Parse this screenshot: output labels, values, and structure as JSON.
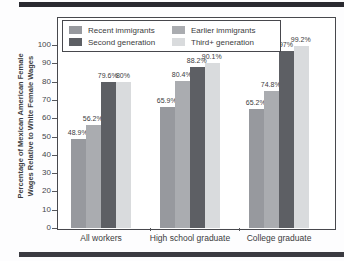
{
  "figure": {
    "background": "#fdfdfe",
    "top_rule_color": "#2a2a30",
    "bottom_rule_color": "#3b3b41",
    "frame_color": "#47484d",
    "text_color": "#3b3c40"
  },
  "chart_data": {
    "type": "bar",
    "title": "",
    "ylabel_line1": "Percentage of Mexican American Female",
    "ylabel_line2": "Wages Relative to White Female Wages",
    "categories": [
      "All workers",
      "High school graduate",
      "College graduate"
    ],
    "series": [
      {
        "name": "Recent immigrants",
        "color": "#97999e",
        "values": [
          48.9,
          65.9,
          65.2
        ],
        "labels": [
          "48.9%",
          "65.9%",
          "65.2%"
        ]
      },
      {
        "name": "Earlier immigrants",
        "color": "#aaacb0",
        "values": [
          56.2,
          80.4,
          74.8
        ],
        "labels": [
          "56.2%",
          "80.4%",
          "74.8%"
        ]
      },
      {
        "name": "Second generation",
        "color": "#5d5f64",
        "values": [
          79.6,
          88.2,
          97.0
        ],
        "labels": [
          "79.6%",
          "88.2%",
          "97%"
        ]
      },
      {
        "name": "Third+ generation",
        "color": "#d9dbdd",
        "values": [
          80.0,
          90.1,
          99.2
        ],
        "labels": [
          "80%",
          "90.1%",
          "99.2%"
        ]
      }
    ],
    "legend_row_major": [
      "Recent immigrants",
      "Earlier immigrants",
      "Second generation",
      "Third+ generation"
    ],
    "legend_position": "top-inside",
    "ylim": [
      0,
      100
    ],
    "yticks": [
      0,
      10,
      20,
      30,
      40,
      50,
      60,
      70,
      80,
      90,
      100
    ],
    "grid": false
  },
  "layout": {
    "group_lefts_px": [
      14,
      103,
      192
    ],
    "xtick_lefts_px": [
      150,
      239
    ],
    "bar_width_px": 15,
    "scale_height_px": 183
  }
}
